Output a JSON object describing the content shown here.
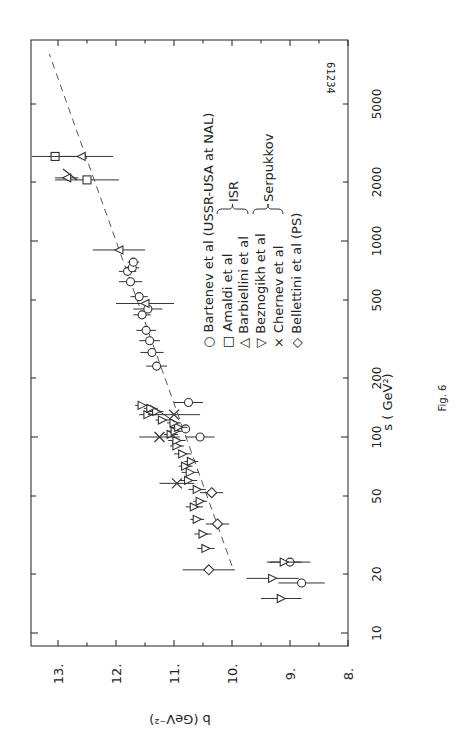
{
  "figure": {
    "caption": "Fig. 6",
    "plate_number": "61234",
    "orientation": "rotated 90 degrees counter-clockwise"
  },
  "chart_data": {
    "type": "scatter",
    "title": "",
    "xlabel": "s ( GeV²)",
    "ylabel": "b (GeV⁻²)",
    "xscale": "log",
    "xlim": [
      10,
      10000
    ],
    "ylim": [
      8,
      13
    ],
    "x_ticks": [
      10,
      20,
      50,
      100,
      200,
      500,
      1000,
      2000,
      5000
    ],
    "x_tick_labels": [
      "10",
      "20",
      "50",
      "100",
      "200",
      "500",
      "1000",
      "2000",
      "5000"
    ],
    "y_ticks": [
      8,
      9,
      10,
      11,
      12,
      13
    ],
    "y_tick_labels": [
      "8.",
      "9.",
      "10.",
      "11.",
      "12.",
      "13."
    ],
    "grid": false,
    "legend_position": "upper left (inside plot)",
    "legend": [
      {
        "marker": "○",
        "label": "Bartenev et al (USSR-USA at NAL)",
        "group": ""
      },
      {
        "marker": "□",
        "label": "Amaldi  et  al",
        "group": "ISR"
      },
      {
        "marker": "△",
        "label": "Barbiellini  et al",
        "group": "ISR"
      },
      {
        "marker": "▽",
        "label": "Beznogikh  et al",
        "group": "Serpukkov"
      },
      {
        "marker": "×",
        "label": "Chernev  et  al",
        "group": "Serpukkov"
      },
      {
        "marker": "◇",
        "label": "Bellettini  et al (PS)",
        "group": ""
      }
    ],
    "fit_line": {
      "style": "dashed",
      "points": [
        [
          22,
          10.0
        ],
        [
          9000,
          13.15
        ]
      ]
    },
    "series": [
      {
        "name": "Bartenev et al",
        "marker": "circle",
        "points": [
          [
            23,
            9.0,
            0.35
          ],
          [
            18,
            8.8,
            0.4
          ],
          [
            100,
            10.55,
            0.25
          ],
          [
            150,
            10.75,
            0.25
          ],
          [
            110,
            10.8,
            0.0
          ],
          [
            230,
            11.3,
            0.18
          ],
          [
            270,
            11.38,
            0.2
          ],
          [
            310,
            11.42,
            0.18
          ],
          [
            350,
            11.48,
            0.17
          ],
          [
            420,
            11.55,
            0.15
          ],
          [
            450,
            11.45,
            0.25
          ],
          [
            520,
            11.6,
            0.15
          ],
          [
            620,
            11.75,
            0.2
          ],
          [
            700,
            11.8,
            0.15
          ],
          [
            730,
            11.72,
            0.12
          ],
          [
            780,
            11.7,
            0.1
          ]
        ]
      },
      {
        "name": "Amaldi et al",
        "marker": "square",
        "points": [
          [
            2050,
            12.5,
            0.55
          ],
          [
            2700,
            13.05,
            0.4
          ]
        ]
      },
      {
        "name": "Barbiellini et al",
        "marker": "triangle-up",
        "points": [
          [
            2100,
            12.85,
            0.2
          ],
          [
            2700,
            12.6,
            0.55
          ],
          [
            900,
            11.95,
            0.45
          ],
          [
            480,
            11.5,
            0.5
          ]
        ]
      },
      {
        "name": "Beznogikh et al",
        "marker": "triangle-down",
        "points": [
          [
            15,
            9.15,
            0.35
          ],
          [
            19,
            9.3,
            0.45
          ],
          [
            23,
            9.1,
            0.3
          ],
          [
            27,
            10.45,
            0.15
          ],
          [
            32,
            10.5,
            0.15
          ],
          [
            38,
            10.6,
            0.12
          ],
          [
            44,
            10.65,
            0.15
          ],
          [
            47,
            10.55,
            0.12
          ],
          [
            54,
            10.6,
            0.15
          ],
          [
            60,
            10.75,
            0.15
          ],
          [
            66,
            10.72,
            0.15
          ],
          [
            71,
            10.8,
            0.12
          ],
          [
            75,
            10.7,
            0.12
          ],
          [
            82,
            10.85,
            0.15
          ],
          [
            90,
            10.95,
            0.12
          ],
          [
            96,
            10.95,
            0.15
          ],
          [
            103,
            11.05,
            0.12
          ],
          [
            107,
            10.98,
            0.12
          ],
          [
            112,
            10.92,
            0.15
          ],
          [
            118,
            11.0,
            0.12
          ],
          [
            122,
            11.2,
            0.12
          ],
          [
            130,
            11.45,
            0.15
          ],
          [
            135,
            11.3,
            0.12
          ],
          [
            140,
            11.4,
            0.12
          ],
          [
            145,
            11.55,
            0.12
          ]
        ]
      },
      {
        "name": "Chernev et al",
        "marker": "cross",
        "points": [
          [
            58,
            10.95,
            0.3
          ],
          [
            100,
            11.25,
            0.35
          ],
          [
            130,
            11.0,
            0.45
          ]
        ]
      },
      {
        "name": "Bellettini et al (PS)",
        "marker": "diamond",
        "points": [
          [
            21,
            10.4,
            0.45
          ],
          [
            36,
            10.25,
            0.2
          ],
          [
            52,
            10.35,
            0.2
          ]
        ]
      }
    ],
    "point_format": "[s, b, b_error]"
  }
}
